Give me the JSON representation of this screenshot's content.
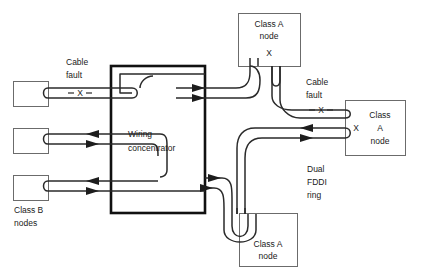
{
  "diagram": {
    "concentrator": {
      "label_line1": "Wiring",
      "label_line2": "concentrator"
    },
    "class_b": {
      "group_label_line1": "Class B",
      "group_label_line2": "nodes",
      "nodes": [
        {
          "id": "class-b-node-1"
        },
        {
          "id": "class-b-node-2"
        },
        {
          "id": "class-b-node-3"
        }
      ]
    },
    "class_a_nodes": [
      {
        "id": "class-a-node-top",
        "label_line1": "Class A",
        "label_line2": "node",
        "fault_marker": "X"
      },
      {
        "id": "class-a-node-right",
        "label_line1": "Class",
        "label_line2": "A",
        "label_line3": "node",
        "fault_marker": "X"
      },
      {
        "id": "class-a-node-bottom",
        "label_line1": "Class A",
        "label_line2": "node"
      }
    ],
    "faults": [
      {
        "id": "cable-fault-left",
        "label_line1": "Cable",
        "label_line2": "fault",
        "marker": "X"
      },
      {
        "id": "cable-fault-right",
        "label_line1": "Cable",
        "label_line2": "fault",
        "marker": "X"
      }
    ],
    "ring": {
      "label_line1": "Dual",
      "label_line2": "FDDI",
      "label_line3": "ring"
    },
    "colors": {
      "background": "#ffffff",
      "node_stroke": "#6b6b6b",
      "concentrator_stroke": "#111111",
      "cable_stroke": "#2a2a2a",
      "text": "#1a1a1a"
    }
  }
}
